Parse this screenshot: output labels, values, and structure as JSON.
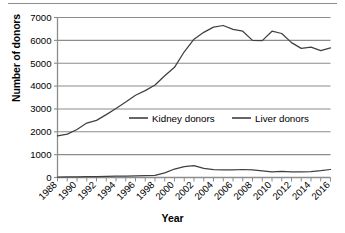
{
  "figure": {
    "divider": "horizontal-rule",
    "background": "#ffffff",
    "line_color": "#404040",
    "grid_color": "#8c8c8c",
    "axis_color": "#8c8c8c"
  },
  "axis": {
    "ylabel": "Number of donors",
    "xlabel": "Year"
  },
  "legend": {
    "items": [
      {
        "label": "Kidney donors",
        "color": "#404040"
      },
      {
        "label": "Liver donors",
        "color": "#404040"
      }
    ]
  },
  "chart_data": {
    "type": "line",
    "title": "",
    "xlabel": "Year",
    "ylabel": "Number of donors",
    "xlim": [
      1988,
      2016
    ],
    "ylim": [
      0,
      7000
    ],
    "yticks": [
      0,
      1000,
      2000,
      3000,
      4000,
      5000,
      6000,
      7000
    ],
    "ytick_labels": [
      "0",
      "1000",
      "2000",
      "3000",
      "4000",
      "5000",
      "6000",
      "7000"
    ],
    "xticks": [
      1988,
      1990,
      1992,
      1994,
      1996,
      1998,
      2000,
      2002,
      2004,
      2006,
      2008,
      2010,
      2012,
      2014,
      2016
    ],
    "xtick_labels": [
      "1988",
      "1990",
      "1992",
      "1994",
      "1996",
      "1998",
      "2000",
      "2002",
      "2004",
      "2006",
      "2008",
      "2010",
      "2012",
      "2014",
      "2016"
    ],
    "minor_xticks_every": 1,
    "grid": "horizontal",
    "legend_position": "center",
    "x": [
      1988,
      1989,
      1990,
      1991,
      1992,
      1993,
      1994,
      1995,
      1996,
      1997,
      1998,
      1999,
      2000,
      2001,
      2002,
      2003,
      2004,
      2005,
      2006,
      2007,
      2008,
      2009,
      2010,
      2011,
      2012,
      2013,
      2014,
      2015,
      2016
    ],
    "series": [
      {
        "name": "Kidney donors",
        "color": "#404040",
        "values": [
          1820,
          1900,
          2100,
          2380,
          2500,
          2750,
          3020,
          3300,
          3600,
          3800,
          4050,
          4450,
          4820,
          5500,
          6050,
          6350,
          6580,
          6650,
          6480,
          6400,
          6000,
          5990,
          6400,
          6300,
          5900,
          5650,
          5700,
          5550,
          5670
        ]
      },
      {
        "name": "Liver donors",
        "color": "#404040",
        "values": [
          20,
          25,
          30,
          35,
          40,
          50,
          60,
          65,
          70,
          80,
          90,
          200,
          370,
          480,
          520,
          400,
          340,
          330,
          330,
          350,
          330,
          290,
          250,
          270,
          250,
          250,
          260,
          300,
          350
        ]
      }
    ]
  }
}
